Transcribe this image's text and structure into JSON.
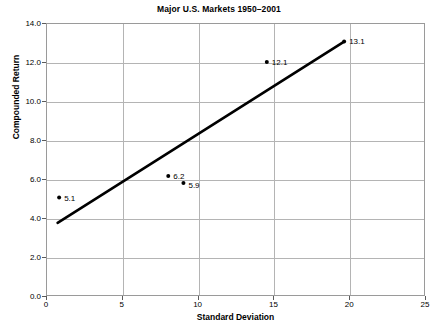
{
  "chart_data": {
    "type": "scatter",
    "title": "Major U.S. Markets 1950–2001",
    "xlabel": "Standard Deviation",
    "ylabel": "Compounded Return",
    "xlim": [
      0,
      25
    ],
    "ylim": [
      0,
      14
    ],
    "xticks": [
      "0",
      "5",
      "10",
      "15",
      "20",
      "25"
    ],
    "xtick_values": [
      0,
      5,
      10,
      15,
      20,
      25
    ],
    "yticks": [
      "0.0",
      "2.0",
      "4.0",
      "6.0",
      "8.0",
      "10.0",
      "12.0",
      "14.0"
    ],
    "ytick_values": [
      0,
      2,
      4,
      6,
      8,
      10,
      12,
      14
    ],
    "grid": true,
    "legend": "none",
    "points": [
      {
        "x": 0.8,
        "y": 5.1,
        "label": "5.1",
        "label_dx": 5,
        "label_dy": 0
      },
      {
        "x": 8.0,
        "y": 6.2,
        "label": "6.2",
        "label_dx": 5,
        "label_dy": 0
      },
      {
        "x": 9.0,
        "y": 5.85,
        "label": "5.9",
        "label_dx": 5,
        "label_dy": 2
      },
      {
        "x": 14.5,
        "y": 12.05,
        "label": "12.1",
        "label_dx": 5,
        "label_dy": 0
      },
      {
        "x": 19.6,
        "y": 13.1,
        "label": "13.1",
        "label_dx": 5,
        "label_dy": -1
      }
    ],
    "trendline": {
      "name": "trend-line",
      "x1": 0.7,
      "y1": 3.8,
      "x2": 19.6,
      "y2": 13.1,
      "color": "#000000",
      "width": 2.6
    },
    "colors": {
      "marker": "#000000",
      "grid": "#b4b4b4",
      "axis": "#9a9a9a",
      "text": "#000000",
      "background": "#ffffff"
    }
  }
}
